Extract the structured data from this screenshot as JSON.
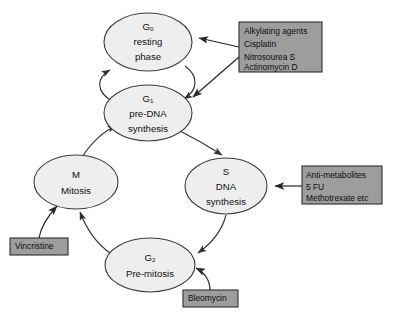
{
  "diagram": {
    "background_color": "#ffffff",
    "node_fill": "#eeeeee",
    "node_stroke": "#3d3d3d",
    "drug_box_fill": "#9d9d9d",
    "drug_box_stroke": "#2e2e2e",
    "arrow_color": "#262626"
  },
  "nodes": [
    {
      "id": "g0",
      "name": "g0-resting-phase",
      "main": "G",
      "subscript": "0",
      "line2": "resting",
      "line3": "phase",
      "cx": 148,
      "cy": 42,
      "rx": 44,
      "ry": 29
    },
    {
      "id": "g1",
      "name": "g1-pre-dna-synthesis",
      "main": "G",
      "subscript": "1",
      "line2": "pre-DNA",
      "line3": "synthesis",
      "cx": 148,
      "cy": 113,
      "rx": 44,
      "ry": 28
    },
    {
      "id": "m",
      "name": "m-mitosis",
      "main": "M",
      "subscript": "",
      "line2": "Mitosis",
      "line3": "",
      "cx": 76,
      "cy": 182,
      "rx": 42,
      "ry": 27
    },
    {
      "id": "s",
      "name": "s-dna-synthesis",
      "main": "S",
      "subscript": "",
      "line2": "DNA",
      "line3": "synthesis",
      "cx": 226,
      "cy": 186,
      "rx": 41,
      "ry": 28
    },
    {
      "id": "g2",
      "name": "g2-pre-mitosis",
      "main": "G",
      "subscript": "2",
      "line2": "Pre-mitosis",
      "line3": "",
      "cx": 150,
      "cy": 265,
      "rx": 45,
      "ry": 27
    }
  ],
  "drug_boxes": [
    {
      "id": "alkylating",
      "name": "alkylating-agents-box",
      "x": 239,
      "y": 22,
      "width": 83,
      "height": 50,
      "lines": [
        "Alkylating agents",
        "Cisplatin",
        "Nitrosourea S",
        "Actinomycin D"
      ],
      "targets": [
        "g0",
        "g1"
      ]
    },
    {
      "id": "antimetabolites",
      "name": "anti-metabolites-box",
      "x": 302,
      "y": 166,
      "width": 80,
      "height": 38,
      "lines": [
        "Anti-metabolites",
        "5 FU",
        "Methotrexate etc"
      ],
      "targets": [
        "s"
      ]
    },
    {
      "id": "vincristine",
      "name": "vincristine-box",
      "x": 10,
      "y": 238,
      "width": 58,
      "height": 17,
      "lines": [
        "Vincristine"
      ],
      "targets": [
        "m"
      ]
    },
    {
      "id": "bleomycin",
      "name": "bleomycin-box",
      "x": 183,
      "y": 290,
      "width": 55,
      "height": 17,
      "lines": [
        "Bleomycin"
      ],
      "targets": [
        "g2"
      ]
    }
  ],
  "cycle_arrows": [
    {
      "name": "arrow-g1-to-g0",
      "from": "g1",
      "to": "g0"
    },
    {
      "name": "arrow-g0-to-g1",
      "from": "g0",
      "to": "g1"
    },
    {
      "name": "arrow-g1-to-s",
      "from": "g1",
      "to": "s"
    },
    {
      "name": "arrow-s-to-g2",
      "from": "s",
      "to": "g2"
    },
    {
      "name": "arrow-g2-to-m",
      "from": "g2",
      "to": "m"
    },
    {
      "name": "arrow-m-to-g1",
      "from": "m",
      "to": "g1"
    }
  ]
}
